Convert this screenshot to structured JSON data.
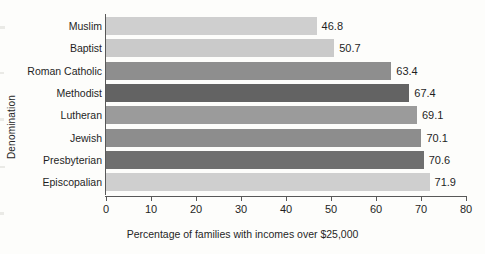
{
  "chart_data": {
    "type": "bar",
    "orientation": "horizontal",
    "title": "",
    "xlabel": "Percentage of families with incomes over $25,000",
    "ylabel": "Denomination",
    "categories": [
      "Muslim",
      "Baptist",
      "Roman Catholic",
      "Methodist",
      "Lutheran",
      "Jewish",
      "Presbyterian",
      "Episcopalian"
    ],
    "values": [
      46.8,
      50.7,
      63.4,
      67.4,
      69.1,
      70.1,
      70.6,
      71.9
    ],
    "value_labels": [
      "46.8",
      "50.7",
      "63.4",
      "67.4",
      "69.1",
      "70.1",
      "70.6",
      "71.9"
    ],
    "bar_colors": [
      "#cfcfcf",
      "#cacaca",
      "#8e8e8e",
      "#636363",
      "#9b9b9b",
      "#8d8d8d",
      "#6f6f6f",
      "#cfcfcf"
    ],
    "xlim": [
      0,
      80
    ],
    "xticks": [
      0,
      10,
      20,
      30,
      40,
      50,
      60,
      70,
      80
    ],
    "xtick_labels": [
      "0",
      "10",
      "20",
      "30",
      "40",
      "50",
      "60",
      "70",
      "80"
    ],
    "grid": false,
    "legend": "none",
    "axis_color": "#585858",
    "background_color": "#fdfdfb"
  }
}
